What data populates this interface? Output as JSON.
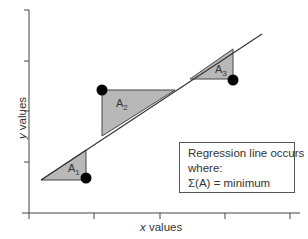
{
  "diagram": {
    "axes": {
      "x_label_var": "x",
      "x_label_rest": " values",
      "y_label_var": "y",
      "y_label_rest": " values"
    },
    "regions": [
      {
        "id": "A1",
        "label_main": "A",
        "label_sub": "1"
      },
      {
        "id": "A2",
        "label_main": "A",
        "label_sub": "2"
      },
      {
        "id": "A3",
        "label_main": "A",
        "label_sub": "3"
      }
    ],
    "note": {
      "line1": "Regression line occurs",
      "line2": "where:",
      "line3": "Σ(A) = minimum"
    },
    "colors": {
      "fill": "#b8b8b8",
      "line": "#333333",
      "point": "#000000"
    }
  }
}
